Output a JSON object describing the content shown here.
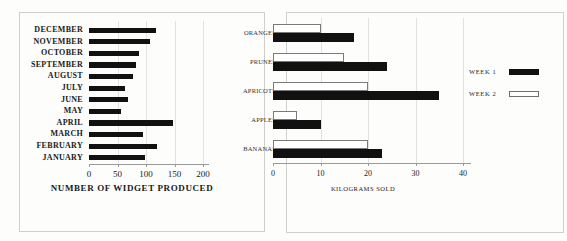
{
  "chart_data": [
    {
      "type": "bar",
      "orientation": "horizontal",
      "title": "",
      "xlabel": "NUMBER OF WIDGET PRODUCED",
      "ylabel": "",
      "xlim": [
        0,
        200
      ],
      "xticks": [
        0,
        50,
        100,
        150,
        200
      ],
      "xtick_labels": [
        "0",
        "50",
        "100",
        "150",
        "200"
      ],
      "grid": true,
      "legend": null,
      "categories": [
        "DECEMBER",
        "NOVEMBER",
        "OCTOBER",
        "SEPTEMBER",
        "AUGUST",
        "JULY",
        "JUNE",
        "MAY",
        "APRIL",
        "MARCH",
        "FEBRUARY",
        "JANUARY"
      ],
      "values": [
        118,
        107,
        88,
        83,
        78,
        63,
        68,
        57,
        148,
        95,
        120,
        98
      ],
      "series_color": "#111111"
    },
    {
      "type": "bar",
      "orientation": "horizontal",
      "title": "",
      "xlabel": "KILOGRAMS SOLD",
      "ylabel": "",
      "xlim": [
        0,
        44
      ],
      "xticks": [
        0,
        10,
        20,
        30,
        40
      ],
      "xtick_labels": [
        "0",
        "10",
        "20",
        "30",
        "40"
      ],
      "grid": true,
      "legend_position": "right",
      "categories": [
        "ORANGES",
        "PRUNES",
        "APRICOTS",
        "APPLES",
        "BANANAS"
      ],
      "series": [
        {
          "name": "WEEK 1",
          "color": "#111111",
          "style": "solid",
          "values": [
            17,
            24,
            35,
            10,
            23
          ]
        },
        {
          "name": "WEEK 2",
          "color": "#ffffff",
          "style": "hollow",
          "values": [
            10,
            15,
            20,
            5,
            20
          ]
        }
      ]
    }
  ],
  "left_chart": {
    "axis_title": "NUMBER OF WIDGET PRODUCED",
    "tick_labels": [
      "0",
      "50",
      "100",
      "150",
      "200"
    ],
    "categories": [
      {
        "label": "DECEMBER",
        "value": 118
      },
      {
        "label": "NOVEMBER",
        "value": 107
      },
      {
        "label": "OCTOBER",
        "value": 88
      },
      {
        "label": "SEPTEMBER",
        "value": 83
      },
      {
        "label": "AUGUST",
        "value": 78
      },
      {
        "label": "JULY",
        "value": 63
      },
      {
        "label": "JUNE",
        "value": 68
      },
      {
        "label": "MAY",
        "value": 57
      },
      {
        "label": "APRIL",
        "value": 148
      },
      {
        "label": "MARCH",
        "value": 95
      },
      {
        "label": "FEBRUARY",
        "value": 120
      },
      {
        "label": "JANUARY",
        "value": 98
      }
    ]
  },
  "right_chart": {
    "axis_title": "KILOGRAMS SOLD",
    "tick_labels": [
      "0",
      "10",
      "20",
      "30",
      "40"
    ],
    "categories": [
      {
        "label": "ORANGES",
        "week1": 17,
        "week2": 10
      },
      {
        "label": "PRUNES",
        "week1": 24,
        "week2": 15
      },
      {
        "label": "APRICOTS",
        "week1": 35,
        "week2": 20
      },
      {
        "label": "APPLES",
        "week1": 10,
        "week2": 5
      },
      {
        "label": "BANANAS",
        "week1": 23,
        "week2": 20
      }
    ],
    "legend": [
      {
        "label": "WEEK 1",
        "style": "solid"
      },
      {
        "label": "WEEK 2",
        "style": "hollow"
      }
    ]
  },
  "colors": {
    "bar_solid": "#111111",
    "bar_hollow_fill": "#ffffff",
    "bar_hollow_stroke": "#7a7a7a",
    "axis": "#9a9a9a",
    "grid": "#e2e2e2",
    "frame": "#cfcfcf",
    "text": "#1a1a1a",
    "background": "#fdfdfc"
  }
}
